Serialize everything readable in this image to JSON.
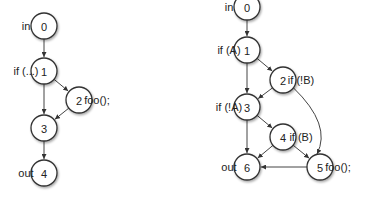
{
  "graphs": [
    {
      "name": "left-cfg",
      "nodes": [
        {
          "id": "0",
          "x": 44,
          "y": 26,
          "label": "in",
          "side": "left"
        },
        {
          "id": "1",
          "x": 44,
          "y": 71,
          "label": "if (...)",
          "side": "left"
        },
        {
          "id": "2",
          "x": 79,
          "y": 100,
          "label": "foo();",
          "side": "right"
        },
        {
          "id": "3",
          "x": 44,
          "y": 128,
          "label": "",
          "side": "left"
        },
        {
          "id": "4",
          "x": 44,
          "y": 173,
          "label": "out",
          "side": "left"
        }
      ],
      "edges": [
        [
          "0",
          "1"
        ],
        [
          "1",
          "2"
        ],
        [
          "1",
          "3"
        ],
        [
          "2",
          "3"
        ],
        [
          "3",
          "4"
        ]
      ]
    },
    {
      "name": "right-cfg",
      "nodes": [
        {
          "id": "0",
          "x": 247,
          "y": 7,
          "label": "in",
          "side": "left"
        },
        {
          "id": "1",
          "x": 247,
          "y": 50,
          "label": "if (A)",
          "side": "left"
        },
        {
          "id": "2",
          "x": 283,
          "y": 80,
          "label": "if (!B)",
          "side": "right"
        },
        {
          "id": "3",
          "x": 247,
          "y": 107,
          "label": "if (!A)",
          "side": "left"
        },
        {
          "id": "4",
          "x": 283,
          "y": 137,
          "label": "if (B)",
          "side": "right"
        },
        {
          "id": "5",
          "x": 320,
          "y": 167,
          "label": "foo();",
          "side": "right"
        },
        {
          "id": "6",
          "x": 247,
          "y": 167,
          "label": "out",
          "side": "left"
        }
      ],
      "edges": [
        [
          "0",
          "1"
        ],
        [
          "1",
          "2"
        ],
        [
          "1",
          "3"
        ],
        [
          "2",
          "3"
        ],
        [
          "2",
          "5"
        ],
        [
          "3",
          "4"
        ],
        [
          "3",
          "6"
        ],
        [
          "4",
          "6"
        ],
        [
          "4",
          "5"
        ],
        [
          "5",
          "6"
        ]
      ]
    }
  ],
  "node_radius": 13
}
